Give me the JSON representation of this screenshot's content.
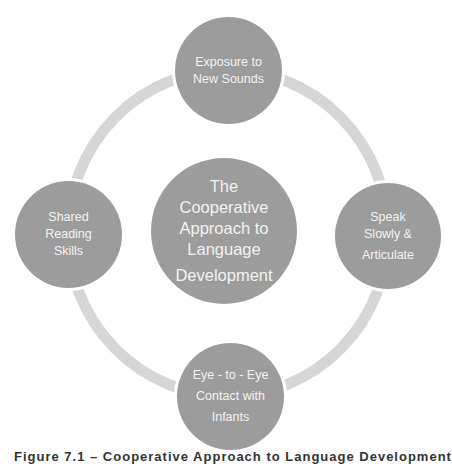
{
  "diagram": {
    "type": "cycle",
    "colors": {
      "node_fill": "#9c9c9c",
      "node_text": "#f2f2f2",
      "ring": "#d6d6d6",
      "background": "#ffffff"
    },
    "center": {
      "lines": [
        "The",
        "Cooperative",
        "Approach to",
        "Language",
        "Development"
      ]
    },
    "nodes": [
      {
        "position": "top",
        "lines": [
          "Exposure to",
          "New Sounds"
        ]
      },
      {
        "position": "right",
        "lines": [
          "Speak",
          "Slowly &",
          "Articulate"
        ]
      },
      {
        "position": "bottom",
        "lines": [
          "Eye - to - Eye",
          "Contact with",
          "Infants"
        ]
      },
      {
        "position": "left",
        "lines": [
          "Shared",
          "Reading",
          "Skills"
        ]
      }
    ]
  },
  "caption": {
    "text": "Figure 7.1 – Cooperative Approach to Language Development",
    "note": "clipped at bottom edge; only letter tops visible"
  }
}
